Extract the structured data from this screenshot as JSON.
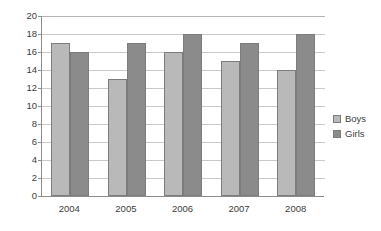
{
  "chart_data": {
    "type": "bar",
    "title": "",
    "subtitle": "",
    "xlabel": "",
    "ylabel": "",
    "categories": [
      "2004",
      "2005",
      "2006",
      "2007",
      "2008"
    ],
    "series": [
      {
        "name": "Boys",
        "color": "#b9b9b9",
        "values": [
          17,
          13,
          16,
          15,
          14
        ]
      },
      {
        "name": "Girls",
        "color": "#8b8b8b",
        "values": [
          16,
          17,
          18,
          17,
          18
        ]
      }
    ],
    "ylim": [
      0,
      20
    ],
    "ytick_step": 2,
    "ytick_labels": [
      "0",
      "2",
      "4",
      "6",
      "8",
      "10",
      "12",
      "14",
      "16",
      "18",
      "20"
    ],
    "grid": true,
    "grid_axis": "y",
    "legend_position": "right"
  },
  "axes": {
    "y_ticks": [
      {
        "value": 20,
        "label": "20"
      },
      {
        "value": 18,
        "label": "18"
      },
      {
        "value": 16,
        "label": "16"
      },
      {
        "value": 14,
        "label": "14"
      },
      {
        "value": 12,
        "label": "12"
      },
      {
        "value": 10,
        "label": "10"
      },
      {
        "value": 8,
        "label": "8"
      },
      {
        "value": 6,
        "label": "6"
      },
      {
        "value": 4,
        "label": "4"
      },
      {
        "value": 2,
        "label": "2"
      },
      {
        "value": 0,
        "label": "0"
      }
    ],
    "x_ticks": [
      {
        "label": "2004"
      },
      {
        "label": "2005"
      },
      {
        "label": "2006"
      },
      {
        "label": "2007"
      },
      {
        "label": "2008"
      }
    ]
  },
  "legend": {
    "items": [
      {
        "label": "Boys",
        "color": "#b9b9b9"
      },
      {
        "label": "Girls",
        "color": "#8b8b8b"
      }
    ]
  }
}
